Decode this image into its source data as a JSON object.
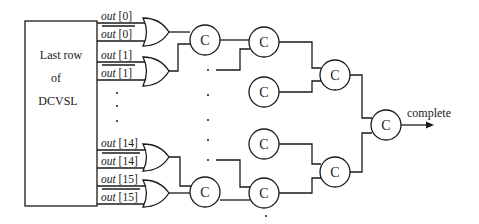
{
  "diagram": {
    "type": "completion-detection tree",
    "block": {
      "label_lines": [
        "Last row",
        "of",
        "DCVSL"
      ]
    },
    "signals": [
      {
        "name": "out",
        "index": "[0]",
        "complement": false
      },
      {
        "name": "out",
        "index": "[0]",
        "complement": true
      },
      {
        "name": "out",
        "index": "[1]",
        "complement": false
      },
      {
        "name": "out",
        "index": "[1]",
        "complement": true
      },
      {
        "name": "out",
        "index": "[14]",
        "complement": false
      },
      {
        "name": "out",
        "index": "[14]",
        "complement": true
      },
      {
        "name": "out",
        "index": "[15]",
        "complement": false
      },
      {
        "name": "out",
        "index": "[15]",
        "complement": true
      }
    ],
    "gates": {
      "or_count_visible": 4,
      "c_element_label": "C",
      "c_elements_visible": 9
    },
    "output": {
      "label": "complete"
    }
  }
}
